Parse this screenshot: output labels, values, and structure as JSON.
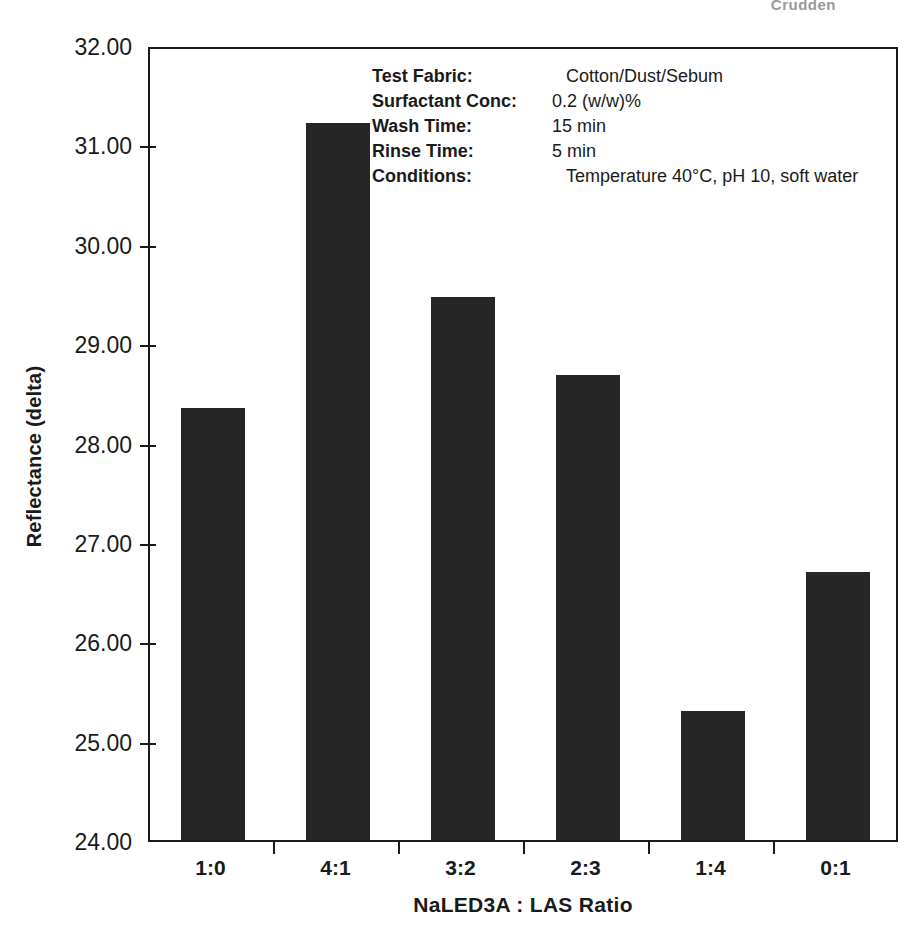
{
  "page": {
    "running_head": "Crudden"
  },
  "chart_data": {
    "type": "bar",
    "title": "",
    "xlabel": "NaLED3A : LAS Ratio",
    "ylabel": "Reflectance (delta)",
    "categories": [
      "1:0",
      "4:1",
      "3:2",
      "2:3",
      "1:4",
      "0:1"
    ],
    "values": [
      28.35,
      31.22,
      29.46,
      28.68,
      25.3,
      26.7
    ],
    "ylim": [
      24.0,
      32.0
    ],
    "ytick_step": 1.0,
    "ytick_labels": [
      "32.00",
      "31.00",
      "30.00",
      "29.00",
      "28.00",
      "27.00",
      "26.00",
      "25.00",
      "24.00"
    ],
    "ytick_values": [
      32,
      31,
      30,
      29,
      28,
      27,
      26,
      25,
      24
    ],
    "grid": false,
    "legend": false,
    "bar_color": "#262626",
    "axis_color": "#1a1a1a"
  },
  "annotation": {
    "rows": [
      {
        "key": "Test Fabric:",
        "value": "Cotton/Dust/Sebum",
        "indent": true
      },
      {
        "key": "Surfactant Conc:",
        "value": "0.2 (w/w)%",
        "indent": false
      },
      {
        "key": "Wash Time:",
        "value": "15 min",
        "indent": false
      },
      {
        "key": "Rinse Time:",
        "value": "5 min",
        "indent": false
      },
      {
        "key": "Conditions:",
        "value": "Temperature 40°C, pH 10, soft water",
        "indent": true
      }
    ]
  }
}
